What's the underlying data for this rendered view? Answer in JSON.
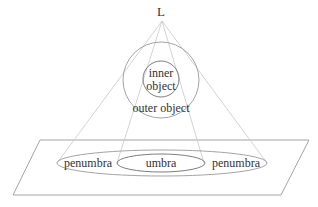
{
  "diagram": {
    "light_source_label": "L",
    "inner_object_label_line1": "inner",
    "inner_object_label_line2": "object",
    "outer_object_label": "outer object",
    "umbra_label": "umbra",
    "penumbra_left_label": "penumbra",
    "penumbra_right_label": "penumbra"
  },
  "colors": {
    "background": "#ffffff",
    "lines": "#c8c8c8",
    "shapes": "#9a9a9a",
    "text": "#333333"
  }
}
